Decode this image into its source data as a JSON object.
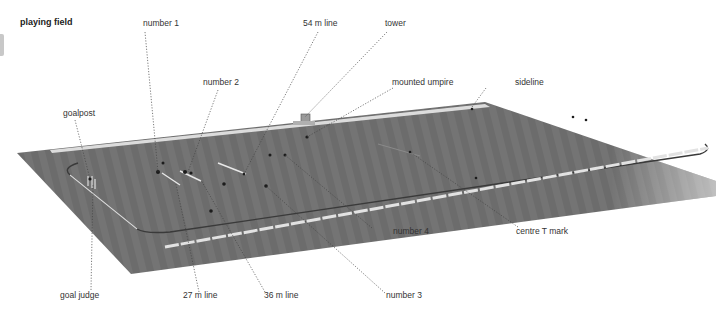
{
  "title": "playing field",
  "labels": {
    "number1": "number 1",
    "number2": "number 2",
    "line54": "54 m line",
    "tower": "tower",
    "mounted_umpire": "mounted umpire",
    "sideline": "sideline",
    "goalpost": "goalpost",
    "number4": "number 4",
    "centre_t_mark": "centre T mark",
    "goal_judge": "goal judge",
    "line27": "27 m line",
    "line36": "36 m line",
    "number3": "number 3"
  },
  "colors": {
    "field": "#6e6e6e",
    "field_dark": "#5a5a5a",
    "line": "#e6e6e6",
    "leader": "#444444",
    "background": "#ffffff"
  }
}
